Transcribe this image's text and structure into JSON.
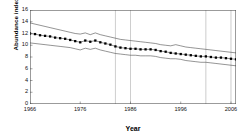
{
  "chart_data": {
    "type": "line",
    "title": "",
    "xlabel": "Year",
    "ylabel": "Abundance index",
    "xlim": [
      1966,
      2007
    ],
    "ylim": [
      0,
      16
    ],
    "ytick_labels": [
      "0",
      "2",
      "4",
      "6",
      "8",
      "10",
      "12",
      "14",
      "16"
    ],
    "ytick_values": [
      0,
      2,
      4,
      6,
      8,
      10,
      12,
      14,
      16
    ],
    "xtick_labels": [
      "1966",
      "1976",
      "1986",
      "1996",
      "2006"
    ],
    "xtick_values": [
      1966,
      1976,
      1986,
      1996,
      2006
    ],
    "grid": "vertical-only",
    "gridline_years": [
      1983,
      1986,
      2001,
      2006
    ],
    "legend": "none",
    "marker": "filled-square",
    "marker_color": "#000000",
    "line_color": "#000000",
    "x": [
      1966,
      1967,
      1968,
      1969,
      1970,
      1971,
      1972,
      1973,
      1974,
      1975,
      1976,
      1977,
      1978,
      1979,
      1980,
      1981,
      1982,
      1983,
      1984,
      1985,
      1986,
      1987,
      1988,
      1989,
      1990,
      1991,
      1992,
      1993,
      1994,
      1995,
      1996,
      1997,
      1998,
      1999,
      2000,
      2001,
      2002,
      2003,
      2004,
      2005,
      2006,
      2007
    ],
    "series": [
      {
        "name": "Upper confidence limit",
        "style": "thin-line",
        "values": [
          13.8,
          13.6,
          13.4,
          13.2,
          13.0,
          12.8,
          12.6,
          12.4,
          12.2,
          12.0,
          11.9,
          12.1,
          11.8,
          12.1,
          11.8,
          11.6,
          11.4,
          11.2,
          11.0,
          10.9,
          10.8,
          10.7,
          10.6,
          10.5,
          10.4,
          10.3,
          10.1,
          10.0,
          9.9,
          10.1,
          9.9,
          9.7,
          9.6,
          9.5,
          9.4,
          9.3,
          9.2,
          9.1,
          9.0,
          8.9,
          8.8,
          8.7
        ]
      },
      {
        "name": "Abundance index",
        "style": "markers",
        "values": [
          12.0,
          11.9,
          11.7,
          11.6,
          11.5,
          11.3,
          11.2,
          11.1,
          10.9,
          10.7,
          10.5,
          10.8,
          10.6,
          10.8,
          10.5,
          10.3,
          10.1,
          9.8,
          9.6,
          9.5,
          9.4,
          9.4,
          9.3,
          9.3,
          9.3,
          9.2,
          9.0,
          8.9,
          8.7,
          8.6,
          8.5,
          8.4,
          8.3,
          8.2,
          8.1,
          8.1,
          8.0,
          7.9,
          7.9,
          7.8,
          7.7,
          7.6
        ]
      },
      {
        "name": "Lower confidence limit",
        "style": "thin-line",
        "values": [
          10.4,
          10.3,
          10.2,
          10.1,
          10.0,
          9.9,
          9.8,
          9.7,
          9.6,
          9.4,
          9.2,
          9.5,
          9.3,
          9.5,
          9.2,
          9.0,
          8.8,
          8.6,
          8.5,
          8.4,
          8.3,
          8.3,
          8.2,
          8.2,
          8.2,
          8.1,
          7.9,
          7.8,
          7.7,
          7.7,
          7.6,
          7.4,
          7.3,
          7.2,
          7.1,
          7.1,
          7.0,
          6.9,
          6.8,
          6.7,
          6.6,
          6.5
        ]
      }
    ]
  }
}
